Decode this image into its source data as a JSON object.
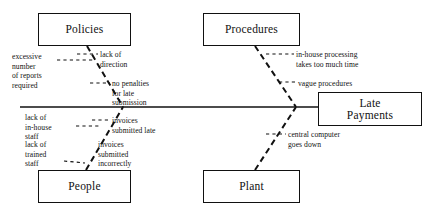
{
  "diagram": {
    "type": "fishbone-ishikawa",
    "effect": {
      "label": "Late\nPayments",
      "box": {
        "x": 318,
        "y": 92,
        "w": 104,
        "h": 34
      }
    },
    "spine": {
      "x1": 20,
      "y1": 107,
      "x2": 318,
      "y2": 107
    },
    "categories": [
      {
        "name": "Policies",
        "label": "Policies",
        "position": "top-left",
        "box": {
          "x": 38,
          "y": 13,
          "w": 93,
          "h": 33
        },
        "bone": {
          "x1": 87,
          "y1": 46,
          "x2": 123,
          "y2": 107
        },
        "causes": [
          {
            "label": "excessive\nnumber\nof reports\nrequired",
            "align": "right",
            "x": 12,
            "y": 52,
            "tick": {
              "x1": 57,
              "y1": 60,
              "x2": 95,
              "y2": 60
            }
          },
          {
            "label": "lack of\ndirection",
            "align": "left",
            "x": 100,
            "y": 50,
            "tick": {
              "x1": 77,
              "y1": 54,
              "x2": 98,
              "y2": 54
            }
          },
          {
            "label": "no penalties\nfor late\nsubmission",
            "align": "left",
            "x": 112,
            "y": 79,
            "tick": {
              "x1": 90,
              "y1": 83,
              "x2": 110,
              "y2": 83
            }
          }
        ]
      },
      {
        "name": "People",
        "label": "People",
        "position": "bottom-left",
        "box": {
          "x": 38,
          "y": 170,
          "w": 93,
          "h": 33
        },
        "bone": {
          "x1": 86,
          "y1": 170,
          "x2": 123,
          "y2": 107
        },
        "causes": [
          {
            "label": "lack of\nin-house\nstaff",
            "align": "right",
            "x": 25,
            "y": 113,
            "tick": {
              "x1": 76,
              "y1": 126,
              "x2": 99,
              "y2": 126
            }
          },
          {
            "label": "invoices\nsubmitted late",
            "align": "left",
            "x": 112,
            "y": 116,
            "tick": {
              "x1": 92,
              "y1": 120,
              "x2": 110,
              "y2": 120
            }
          },
          {
            "label": "lack of\ntrained\nstaff",
            "align": "right",
            "x": 25,
            "y": 140,
            "tick": {
              "x1": 64,
              "y1": 161,
              "x2": 85,
              "y2": 163
            }
          },
          {
            "label": "invoices\nsubmitted\nincorrectly",
            "align": "left",
            "x": 98,
            "y": 140,
            "tick": null
          }
        ]
      },
      {
        "name": "Procedures",
        "label": "Procedures",
        "position": "top-right",
        "box": {
          "x": 203,
          "y": 13,
          "w": 97,
          "h": 33
        },
        "bone": {
          "x1": 255,
          "y1": 46,
          "x2": 296,
          "y2": 107
        },
        "causes": [
          {
            "label": "in-house processing\ntakes too much time",
            "align": "left",
            "x": 296,
            "y": 50,
            "tick": {
              "x1": 266,
              "y1": 54,
              "x2": 294,
              "y2": 54
            }
          },
          {
            "label": "vague procedures",
            "align": "left",
            "x": 298,
            "y": 79,
            "tick": {
              "x1": 279,
              "y1": 82,
              "x2": 296,
              "y2": 82
            }
          }
        ]
      },
      {
        "name": "Plant",
        "label": "Plant",
        "position": "bottom-right",
        "box": {
          "x": 203,
          "y": 170,
          "w": 97,
          "h": 33
        },
        "bone": {
          "x1": 255,
          "y1": 170,
          "x2": 296,
          "y2": 107
        },
        "causes": [
          {
            "label": "central computer\ngoes down",
            "align": "left",
            "x": 288,
            "y": 130,
            "tick": {
              "x1": 266,
              "y1": 134,
              "x2": 286,
              "y2": 134
            }
          }
        ]
      }
    ],
    "style": {
      "line_color": "#111111",
      "background": "#ffffff",
      "box_border": "#111111"
    }
  }
}
